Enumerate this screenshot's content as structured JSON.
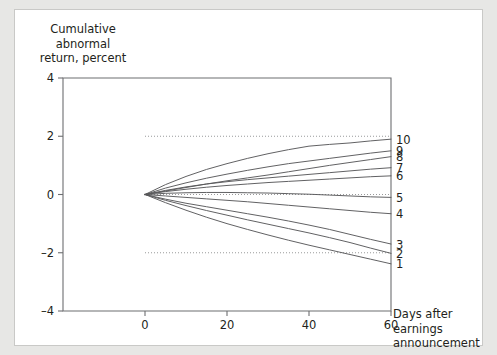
{
  "figure": {
    "background_color": "#e7e7e5",
    "panel_color": "#ffffff",
    "axis_color": "#6d6e71",
    "curve_color": "#58595b",
    "grid_color": "#8d8e90"
  },
  "chart_data": {
    "type": "line",
    "title": "",
    "ylabel": "Cumulative\nabnormal\nreturn, percent",
    "xlabel": "Days after\nearnings\nannouncement",
    "xlim": [
      -20,
      60
    ],
    "ylim": [
      -4,
      4
    ],
    "xticks": [
      0,
      20,
      40,
      60
    ],
    "xtick_labels": [
      "0",
      "20",
      "40",
      "60"
    ],
    "yticks": [
      4,
      2,
      0,
      -2,
      -4
    ],
    "ytick_labels": [
      "4",
      "2",
      "0",
      "–2",
      "–4"
    ],
    "gridlines_y": [
      2,
      0,
      -2
    ],
    "grid": "dotted-horizontal",
    "legend_position": "right-edge-inline",
    "x": [
      0,
      5,
      10,
      15,
      20,
      25,
      30,
      35,
      40,
      45,
      50,
      55,
      60
    ],
    "series": [
      {
        "name": "10",
        "label": "10",
        "end_value": 1.9,
        "values": [
          0,
          0.34,
          0.62,
          0.86,
          1.06,
          1.24,
          1.4,
          1.54,
          1.66,
          1.72,
          1.77,
          1.84,
          1.9
        ]
      },
      {
        "name": "9",
        "label": "9",
        "end_value": 1.5,
        "values": [
          0,
          0.22,
          0.4,
          0.56,
          0.7,
          0.83,
          0.95,
          1.06,
          1.15,
          1.24,
          1.33,
          1.42,
          1.5
        ]
      },
      {
        "name": "8",
        "label": "8",
        "end_value": 1.3,
        "values": [
          0,
          0.12,
          0.24,
          0.36,
          0.47,
          0.57,
          0.67,
          0.78,
          0.89,
          1.0,
          1.1,
          1.2,
          1.3
        ]
      },
      {
        "name": "7",
        "label": "7",
        "end_value": 0.92,
        "values": [
          0,
          0.14,
          0.26,
          0.36,
          0.44,
          0.51,
          0.57,
          0.63,
          0.69,
          0.75,
          0.81,
          0.87,
          0.92
        ]
      },
      {
        "name": "6",
        "label": "6",
        "end_value": 0.64,
        "values": [
          0,
          0.1,
          0.18,
          0.25,
          0.31,
          0.36,
          0.41,
          0.45,
          0.49,
          0.53,
          0.57,
          0.61,
          0.64
        ]
      },
      {
        "name": "5",
        "label": "5",
        "end_value": -0.1,
        "values": [
          0,
          0.04,
          0.06,
          0.07,
          0.07,
          0.06,
          0.05,
          0.03,
          0.01,
          -0.02,
          -0.05,
          -0.08,
          -0.1
        ]
      },
      {
        "name": "4",
        "label": "4",
        "end_value": -0.66,
        "values": [
          0,
          -0.05,
          -0.1,
          -0.15,
          -0.2,
          -0.25,
          -0.31,
          -0.37,
          -0.43,
          -0.49,
          -0.55,
          -0.61,
          -0.66
        ]
      },
      {
        "name": "3",
        "label": "3",
        "end_value": -1.7,
        "values": [
          0,
          -0.16,
          -0.3,
          -0.42,
          -0.54,
          -0.66,
          -0.78,
          -0.91,
          -1.05,
          -1.2,
          -1.37,
          -1.54,
          -1.7
        ]
      },
      {
        "name": "2",
        "label": "2",
        "end_value": -2.02,
        "values": [
          0,
          -0.2,
          -0.38,
          -0.55,
          -0.71,
          -0.87,
          -1.02,
          -1.17,
          -1.32,
          -1.48,
          -1.65,
          -1.84,
          -2.02
        ]
      },
      {
        "name": "1",
        "label": "1",
        "end_value": -2.38,
        "values": [
          0,
          -0.28,
          -0.54,
          -0.78,
          -1.0,
          -1.2,
          -1.39,
          -1.57,
          -1.74,
          -1.9,
          -2.06,
          -2.22,
          -2.38
        ]
      }
    ]
  }
}
